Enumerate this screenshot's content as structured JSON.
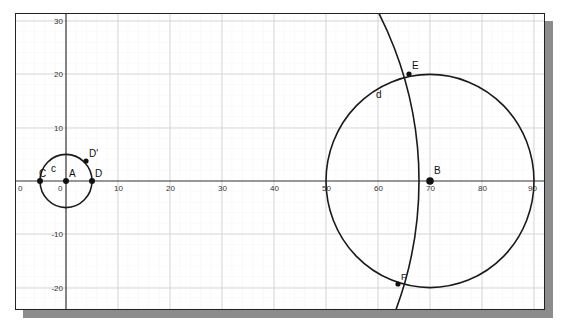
{
  "window": {
    "title": "Geometry construction graphics view"
  },
  "axes": {
    "x_ticks": [
      "0",
      "10",
      "20",
      "30",
      "40",
      "50",
      "60",
      "70",
      "80",
      "90"
    ],
    "y_ticks": [
      "30",
      "20",
      "10",
      "-10",
      "-20"
    ],
    "x_left_label": "0",
    "origin_label": "0",
    "xlim": [
      -9,
      93
    ],
    "ylim": [
      -24.5,
      31.5
    ],
    "grid": true
  },
  "objects": {
    "points": [
      {
        "name": "A",
        "x": 0,
        "y": 0
      },
      {
        "name": "C",
        "x": -5,
        "y": 0
      },
      {
        "name": "D",
        "x": 5,
        "y": 0
      },
      {
        "name": "D'",
        "x": 3.8,
        "y": 3.8
      },
      {
        "name": "B",
        "x": 70,
        "y": 0
      },
      {
        "name": "E",
        "x": 66,
        "y": 20
      },
      {
        "name": "F",
        "x": 64,
        "y": -19.5
      }
    ],
    "circles": [
      {
        "name": "c",
        "center": "A",
        "radius": 5
      },
      {
        "name": "d",
        "center": "B",
        "radius": 20
      },
      {
        "name": "arc",
        "center": "A",
        "radius": 68.5
      }
    ]
  },
  "labels": {
    "A": "A",
    "B": "B",
    "C": "C",
    "D": "D",
    "Dp": "D'",
    "E": "E",
    "F": "F",
    "c": "c",
    "d": "d"
  },
  "colors": {
    "stroke": "#1a1a1a",
    "grid": "#d6d6d6",
    "axis": "#333333",
    "shadow": "#8c8c8c"
  }
}
